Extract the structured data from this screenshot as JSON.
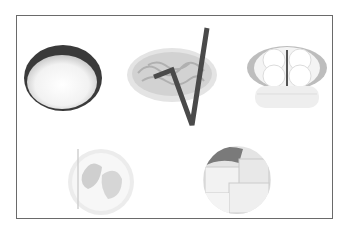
{
  "figure": {
    "items": [
      {
        "name": "rice-bowl",
        "label": "bowl of rice",
        "selected": false
      },
      {
        "name": "noodle-plate",
        "label": "plate of noodles",
        "selected": true
      },
      {
        "name": "steamed-buns",
        "label": "steamer basket with buns",
        "selected": false
      },
      {
        "name": "dumplings",
        "label": "dumplings",
        "selected": false
      },
      {
        "name": "tofu",
        "label": "tofu cubes",
        "selected": false
      }
    ],
    "mark": {
      "type": "check-mark",
      "color": "#4a4a4a",
      "target": "noodle-plate"
    },
    "colors": {
      "border": "#6a6a6a",
      "background": "#ffffff",
      "ink": "#4a4a4a"
    }
  }
}
